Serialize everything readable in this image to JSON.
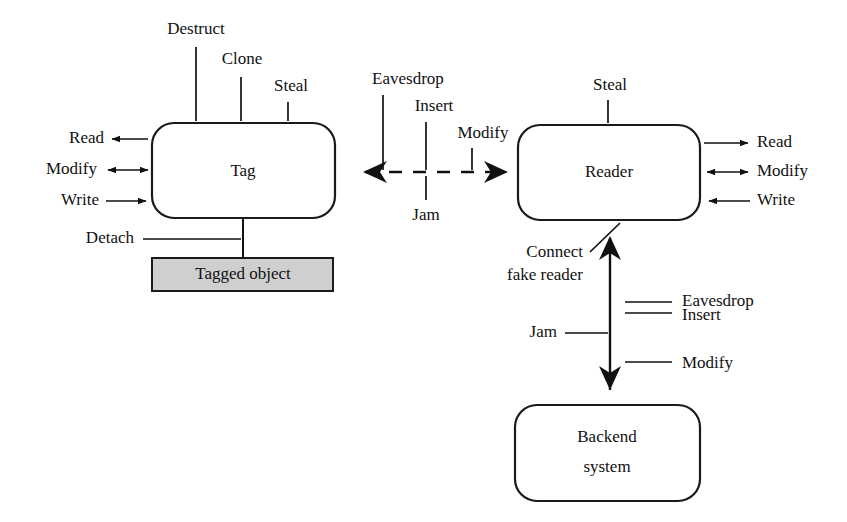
{
  "diagram": {
    "background_color": "#ffffff",
    "line_color": "#111111",
    "fill_color": "#cfcfcf",
    "nodes": [
      {
        "id": "tag",
        "label": "Tag",
        "shape": "rounded-rect",
        "fill": "#ffffff"
      },
      {
        "id": "tagged_object",
        "label": "Tagged object",
        "shape": "rect",
        "fill": "#cfcfcf"
      },
      {
        "id": "reader",
        "label": "Reader",
        "shape": "rounded-rect",
        "fill": "#ffffff"
      },
      {
        "id": "backend",
        "label_line1": "Backend",
        "label_line2": "system",
        "shape": "rounded-rect",
        "fill": "#ffffff"
      }
    ],
    "tag_top_threats": [
      {
        "label": "Destruct"
      },
      {
        "label": "Clone"
      },
      {
        "label": "Steal"
      }
    ],
    "tag_left_interfaces": [
      {
        "label": "Read",
        "direction": "out"
      },
      {
        "label": "Modify",
        "direction": "both"
      },
      {
        "label": "Write",
        "direction": "in"
      }
    ],
    "tag_bottom_threat": {
      "label": "Detach"
    },
    "air_interface_threats_above": [
      {
        "label": "Eavesdrop"
      },
      {
        "label": "Insert"
      },
      {
        "label": "Modify"
      }
    ],
    "air_interface_threats_below": [
      {
        "label": "Jam"
      }
    ],
    "reader_top_threats": [
      {
        "label": "Steal"
      }
    ],
    "reader_right_interfaces": [
      {
        "label": "Read",
        "direction": "out"
      },
      {
        "label": "Modify",
        "direction": "both"
      },
      {
        "label": "Write",
        "direction": "in"
      }
    ],
    "reader_backend_threats_right": [
      {
        "label": "Eavesdrop"
      },
      {
        "label": "Insert"
      },
      {
        "label": "Modify"
      }
    ],
    "reader_backend_threats_left": [
      {
        "label": "Jam"
      }
    ],
    "reader_attach_threat": {
      "label_line1": "Connect",
      "label_line2": "fake reader"
    }
  }
}
